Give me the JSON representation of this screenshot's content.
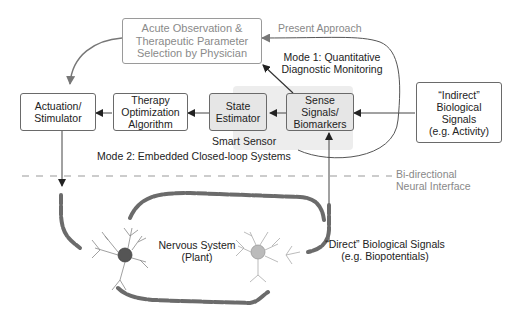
{
  "diagram": {
    "boxes": {
      "physician": "Acute Observation &\nTherapeutic Parameter\nSelection by Physician",
      "actuation": "Actuation/\nStimulator",
      "therapy": "Therapy\nOptimization\nAlgorithm",
      "state_estimator": "State\nEstimator",
      "sense_signals": "Sense Signals/\nBiomarkers",
      "indirect": "“Indirect”\nBiological\nSignals\n(e.g. Activity)"
    },
    "labels": {
      "present_approach": "Present Approach",
      "mode1_line1": "Mode 1: Quantitative",
      "mode1_line2": "Diagnostic Monitoring",
      "smart_sensor": "Smart Sensor",
      "mode2": "Mode 2: Embedded Closed-loop Systems",
      "interface_line1": "Bi-directional",
      "interface_line2": "Neural Interface",
      "nervous_line1": "Nervous System",
      "nervous_line2": "(Plant)",
      "direct_line1": "“Direct” Biological Signals",
      "direct_line2": "(e.g. Biopotentials)"
    },
    "colors": {
      "line": "#555555",
      "grey_line": "#7a7a7a",
      "smart_sensor_bg": "#ededed",
      "axon": "#6b6b6b"
    }
  }
}
